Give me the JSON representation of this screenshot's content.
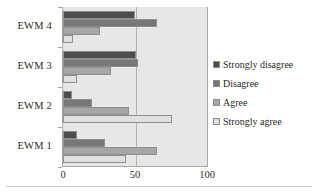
{
  "chart_data": {
    "type": "bar",
    "orientation": "horizontal",
    "title": "",
    "xlabel": "",
    "ylabel": "",
    "categories": [
      "EWM 1",
      "EWM 2",
      "EWM 3",
      "EWM 4"
    ],
    "category_order_top_to_bottom": [
      "EWM 4",
      "EWM 3",
      "EWM 2",
      "EWM 1"
    ],
    "series": [
      {
        "name": "Strongly disagree",
        "color": "#4d4d4d",
        "values": [
          10,
          6,
          51,
          50
        ]
      },
      {
        "name": "Disagree",
        "color": "#777777",
        "values": [
          29,
          20,
          52,
          65
        ]
      },
      {
        "name": "Agree",
        "color": "#a6a6a6",
        "values": [
          65,
          46,
          33,
          26
        ]
      },
      {
        "name": "Strongly agree",
        "color": "#e0e0e0",
        "values": [
          44,
          76,
          10,
          7
        ]
      }
    ],
    "xlim": [
      0,
      100
    ],
    "xticks": [
      0,
      50,
      100
    ],
    "xticklabels": [
      "0",
      "50",
      "100"
    ],
    "grid": true,
    "gridlines_x": [
      50
    ],
    "legend_position": "right",
    "plot_background": "#e7e7e7",
    "axis_color": "#a8a8a8"
  },
  "axis": {
    "x_ticks": [
      {
        "label": "0",
        "value": 0
      },
      {
        "label": "50",
        "value": 50
      },
      {
        "label": "100",
        "value": 100
      }
    ],
    "y_categories": [
      {
        "label": "EWM 4"
      },
      {
        "label": "EWM 3"
      },
      {
        "label": "EWM 2"
      },
      {
        "label": "EWM 1"
      }
    ]
  },
  "legend": {
    "items": [
      {
        "label": "Strongly disagree",
        "color": "#4d4d4d"
      },
      {
        "label": "Disagree",
        "color": "#777777"
      },
      {
        "label": "Agree",
        "color": "#a6a6a6"
      },
      {
        "label": "Strongly agree",
        "color": "#e0e0e0"
      }
    ]
  }
}
